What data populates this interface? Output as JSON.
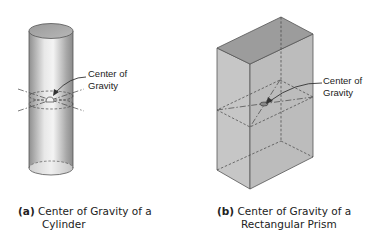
{
  "figure_a": {
    "label_line1": "Center of",
    "label_line2": "Gravity",
    "caption_tag": "(a)",
    "caption_line1": "Center of Gravity of a",
    "caption_line2": "Cylinder"
  },
  "figure_b": {
    "label_line1": "Center of",
    "label_line2": "Gravity",
    "caption_tag": "(b)",
    "caption_line1": "Center of Gravity of a",
    "caption_line2": "Rectangular Prism"
  },
  "colors": {
    "outline": "#555555",
    "prism_top": "#9a9a9a",
    "prism_front": "#c8c8c8",
    "prism_side": "#bdbdbd"
  }
}
